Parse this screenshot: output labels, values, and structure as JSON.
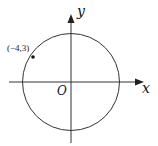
{
  "diagram": {
    "type": "coordinate-plane-circle",
    "axes": {
      "x_label": "x",
      "y_label": "y",
      "origin_label": "O"
    },
    "circle": {
      "center": [
        0,
        0
      ],
      "passes_through": [
        -4,
        3
      ]
    },
    "point": {
      "label": "(−4,3)",
      "coords": [
        -4,
        3
      ]
    },
    "colors": {
      "stroke": "#222222",
      "background": "#ffffff"
    }
  }
}
